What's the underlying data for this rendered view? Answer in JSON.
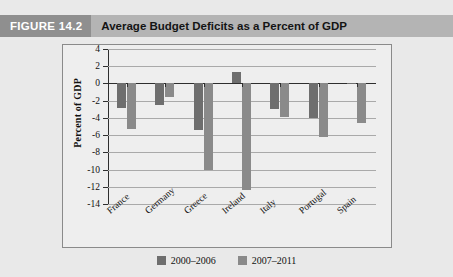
{
  "figure": {
    "badge": "FIGURE 14.2",
    "title": "Average Budget Deficits as a Percent of GDP"
  },
  "colors": {
    "header_bar": "#b4b4b4",
    "badge_bg": "#8f8f8f",
    "series_2000_2006": "#6e6e6e",
    "series_2007_2011": "#8a8a8a",
    "panel_bg": "#eeeeee",
    "page_bg": "#e9e9e9"
  },
  "chart_data": {
    "type": "bar",
    "title": "Average Budget Deficits as a Percent of GDP",
    "xlabel": "",
    "ylabel": "Percent of GDP",
    "ylim": [
      -14,
      4
    ],
    "ytick_step": 2,
    "ytick_labels": [
      "4",
      "2",
      "0",
      "-2",
      "-4",
      "-6",
      "-8",
      "-10",
      "-12",
      "-14"
    ],
    "ytick_values": [
      4,
      2,
      0,
      -2,
      -4,
      -6,
      -8,
      -10,
      -12,
      -14
    ],
    "grid": true,
    "legend_position": "bottom",
    "categories": [
      "France",
      "Germany",
      "Greece",
      "Ireland",
      "Italy",
      "Portugal",
      "Spain"
    ],
    "series": [
      {
        "name": "2000–2006",
        "color": "#6e6e6e",
        "values": [
          -2.8,
          -2.5,
          -5.4,
          1.3,
          -3.0,
          -4.0,
          -0.1
        ]
      },
      {
        "name": "2007–2011",
        "color": "#8a8a8a",
        "values": [
          -5.3,
          -1.6,
          -10.1,
          -12.4,
          -3.9,
          -6.2,
          -4.6
        ]
      }
    ]
  }
}
